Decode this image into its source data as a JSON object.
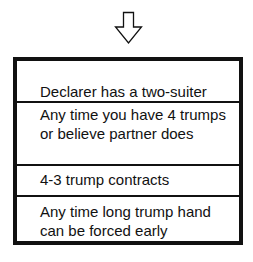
{
  "diagram": {
    "arrow": {
      "icon": "down-arrow-outline-icon",
      "color": "#111111"
    },
    "box": {
      "border_color": "#111111",
      "rows": [
        {
          "text": "Declarer has a two-suiter"
        },
        {
          "text": "Any time you have 4 trumps or believe partner does"
        },
        {
          "text": "4-3 trump contracts"
        },
        {
          "text": "Any time long trump hand can be forced early"
        }
      ]
    }
  }
}
